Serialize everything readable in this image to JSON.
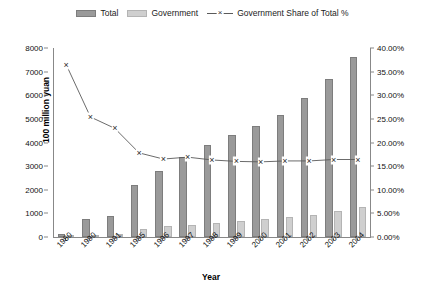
{
  "chart_data": {
    "type": "bar",
    "title": "",
    "xlabel": "Year",
    "ylabel": "100 million yuan",
    "y2label": "",
    "categories": [
      "1980",
      "1990",
      "1991",
      "1995",
      "1996",
      "1997",
      "1998",
      "1999",
      "2000",
      "2001",
      "2002",
      "2003",
      "2004"
    ],
    "series": [
      {
        "name": "Total",
        "type": "bar",
        "axis": "left",
        "color": "#9a9a9a",
        "values": [
          130,
          760,
          890,
          2200,
          2800,
          3400,
          3900,
          4300,
          4700,
          5150,
          5900,
          6700,
          7600
        ]
      },
      {
        "name": "Government",
        "type": "bar",
        "axis": "left",
        "color": "#cfcfcf",
        "values": [
          50,
          100,
          120,
          350,
          450,
          500,
          600,
          680,
          750,
          830,
          950,
          1100,
          1250
        ]
      },
      {
        "name": "Government Share of Total %",
        "type": "line",
        "axis": "right",
        "color": "#5a5a5a",
        "marker": "x",
        "values": [
          36.5,
          25.4,
          23.0,
          17.8,
          16.5,
          16.9,
          16.3,
          16.0,
          15.9,
          16.1,
          16.1,
          16.4,
          16.4
        ]
      }
    ],
    "ylim": [
      0,
      8000
    ],
    "yticks": [
      0,
      1000,
      2000,
      3000,
      4000,
      5000,
      6000,
      7000,
      8000
    ],
    "ytick_labels": [
      "0",
      "1000",
      "2000",
      "3000",
      "4000",
      "5000",
      "6000",
      "7000",
      "8000"
    ],
    "y2lim": [
      0,
      40
    ],
    "y2ticks": [
      0,
      5,
      10,
      15,
      20,
      25,
      30,
      35,
      40
    ],
    "y2tick_labels": [
      "0.00%",
      "5.00%",
      "10.00%",
      "15.00%",
      "20.00%",
      "25.00%",
      "30.00%",
      "35.00%",
      "40.00%"
    ],
    "grid": false,
    "legend_position": "top"
  },
  "legend": {
    "items": [
      {
        "label": "Total",
        "kind": "swatch"
      },
      {
        "label": "Government",
        "kind": "swatch"
      },
      {
        "label": "Government Share of Total %",
        "kind": "line-marker",
        "marker": "x"
      }
    ]
  }
}
